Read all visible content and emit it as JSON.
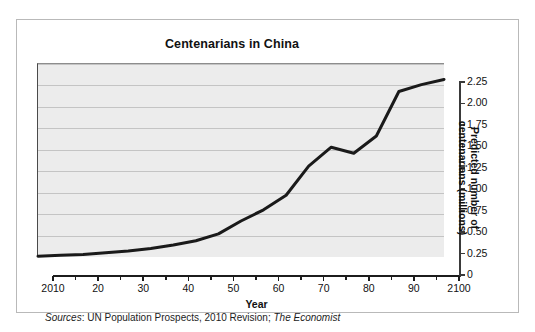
{
  "figure": {
    "title": "Centenarians in China",
    "source_prefix": "Sources",
    "source_sep": ": ",
    "source_body": "UN Population Prospects, 2010 Revision; ",
    "source_publication": "The Economist",
    "border_color": "#b9b9b9",
    "plot_background": "#ececec",
    "gridline_color": "#c4c4c4",
    "line_color": "#1a1a1a"
  },
  "chart_data": {
    "type": "line",
    "title": "Centenarians in China",
    "xlabel": "Year",
    "ylabel": "Predicted number of centenarians (millions)",
    "ylabel_line1": "Predicted number of",
    "ylabel_line2": "centenarians (millions)",
    "xlim": [
      2010,
      2100
    ],
    "ylim": [
      0,
      2.25
    ],
    "xticks": [
      2010,
      2020,
      2030,
      2040,
      2050,
      2060,
      2070,
      2080,
      2090,
      2100
    ],
    "xtick_labels": [
      "2010",
      "20",
      "30",
      "40",
      "50",
      "60",
      "70",
      "80",
      "90",
      "2100"
    ],
    "xtick_minor_step": 5,
    "yticks": [
      0,
      0.25,
      0.5,
      0.75,
      1.0,
      1.25,
      1.5,
      1.75,
      2.0,
      2.25
    ],
    "ytick_labels": [
      "0",
      "0.25",
      "0.50",
      "0.75",
      "1.00",
      "1.25",
      "1.50",
      "1.75",
      "2.00",
      "2.25"
    ],
    "grid": "horizontal",
    "legend": "none",
    "series": [
      {
        "name": "Predicted centenarians",
        "x": [
          2010,
          2015,
          2020,
          2025,
          2030,
          2035,
          2040,
          2045,
          2050,
          2055,
          2060,
          2065,
          2070,
          2075,
          2080,
          2085,
          2090,
          2095,
          2100
        ],
        "values": [
          0.01,
          0.02,
          0.03,
          0.05,
          0.07,
          0.1,
          0.14,
          0.19,
          0.27,
          0.42,
          0.55,
          0.72,
          1.06,
          1.28,
          1.21,
          1.41,
          1.93,
          2.01,
          2.07
        ]
      }
    ]
  }
}
